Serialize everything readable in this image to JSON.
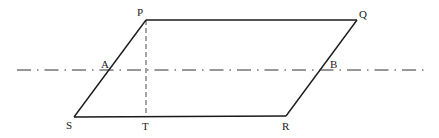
{
  "diagram": {
    "type": "geometry",
    "title": "",
    "shape": "parallelogram",
    "vertices": {
      "P": {
        "label": "P",
        "x": 146,
        "y": 20,
        "label_x": 137,
        "label_y": 16
      },
      "Q": {
        "label": "Q",
        "x": 357,
        "y": 20,
        "label_x": 359,
        "label_y": 18
      },
      "R": {
        "label": "R",
        "x": 286,
        "y": 116,
        "label_x": 282,
        "label_y": 130
      },
      "S": {
        "label": "S",
        "x": 74,
        "y": 117,
        "label_x": 66,
        "label_y": 129
      }
    },
    "points": {
      "A": {
        "label": "A",
        "x": 106,
        "y": 70,
        "label_x": 101,
        "label_y": 68
      },
      "B": {
        "label": "B",
        "x": 320,
        "y": 70,
        "label_x": 330,
        "label_y": 68
      },
      "T": {
        "label": "T",
        "x": 146,
        "y": 117,
        "label_x": 142,
        "label_y": 130
      }
    },
    "edges": [
      {
        "from": "P",
        "to": "Q",
        "style": "solid"
      },
      {
        "from": "Q",
        "to": "R",
        "style": "solid"
      },
      {
        "from": "R",
        "to": "S",
        "style": "solid"
      },
      {
        "from": "S",
        "to": "P",
        "style": "solid"
      }
    ],
    "auxiliary_lines": [
      {
        "name": "height PT",
        "from": "P",
        "to": "T",
        "style": "dashed"
      },
      {
        "name": "axis line through A and B",
        "x1": 17,
        "y1": 70,
        "x2": 425,
        "y2": 70,
        "style": "dash-dot"
      }
    ],
    "colors": {
      "line": "#1a1a1a",
      "background": "#ffffff"
    }
  }
}
